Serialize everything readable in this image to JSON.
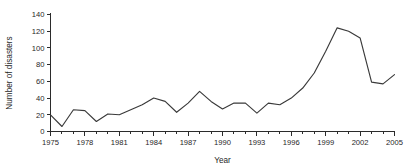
{
  "chart_data": {
    "type": "line",
    "title": "",
    "xlabel": "Year",
    "ylabel": "Number of disasters",
    "xlim": [
      1975,
      2005
    ],
    "ylim": [
      0,
      140
    ],
    "grid": false,
    "legend": "none",
    "x_tick_labels": [
      "1975",
      "1978",
      "1981",
      "1984",
      "1987",
      "1990",
      "1993",
      "1996",
      "1999",
      "2002",
      "2005"
    ],
    "x_tick_values": [
      1975,
      1978,
      1981,
      1984,
      1987,
      1990,
      1993,
      1996,
      1999,
      2002,
      2005
    ],
    "x_minor_ticks": [
      1976,
      1977,
      1979,
      1980,
      1982,
      1983,
      1985,
      1986,
      1988,
      1989,
      1991,
      1992,
      1994,
      1995,
      1997,
      1998,
      2000,
      2001,
      2003,
      2004
    ],
    "y_tick_labels": [
      "0",
      "20",
      "40",
      "60",
      "80",
      "100",
      "120",
      "140"
    ],
    "y_tick_values": [
      0,
      20,
      40,
      60,
      80,
      100,
      120,
      140
    ],
    "line_color": "#3a3a3a",
    "x": [
      1975,
      1976,
      1977,
      1978,
      1979,
      1980,
      1981,
      1982,
      1983,
      1984,
      1985,
      1986,
      1987,
      1988,
      1989,
      1990,
      1991,
      1992,
      1993,
      1994,
      1995,
      1996,
      1997,
      1998,
      1999,
      2000,
      2001,
      2002,
      2003,
      2004,
      2005
    ],
    "values": [
      20,
      6,
      26,
      25,
      12,
      21,
      20,
      26,
      32,
      40,
      36,
      23,
      34,
      48,
      36,
      27,
      34,
      34,
      22,
      34,
      32,
      40,
      52,
      70,
      96,
      124,
      120,
      112,
      59,
      57,
      68
    ],
    "series": [
      {
        "name": "Number of disasters",
        "values": [
          20,
          6,
          26,
          25,
          12,
          21,
          20,
          26,
          32,
          40,
          36,
          23,
          34,
          48,
          36,
          27,
          34,
          34,
          22,
          34,
          32,
          40,
          52,
          70,
          96,
          124,
          120,
          112,
          59,
          57,
          68
        ]
      }
    ]
  }
}
